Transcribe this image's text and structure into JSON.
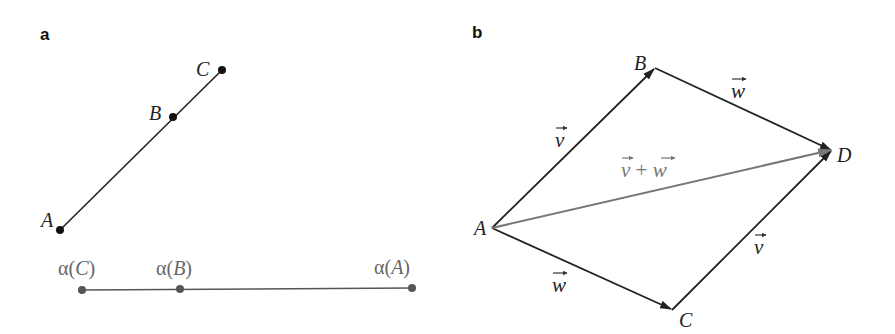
{
  "panels": [
    {
      "label": "a",
      "points": {
        "A": {
          "label": "A",
          "x": 60,
          "y": 230
        },
        "B": {
          "label": "B",
          "x": 173,
          "y": 117
        },
        "C": {
          "label": "C",
          "x": 222,
          "y": 70
        }
      },
      "image_line": {
        "points": [
          {
            "label_fn": "α(",
            "label_var": "C",
            "label_close": ")",
            "x": 82,
            "y": 290
          },
          {
            "label_fn": "α(",
            "label_var": "B",
            "label_close": ")",
            "x": 180,
            "y": 289
          },
          {
            "label_fn": "α(",
            "label_var": "A",
            "label_close": ")",
            "x": 412,
            "y": 288
          }
        ]
      }
    },
    {
      "label": "b",
      "points": {
        "A": {
          "label": "A",
          "x": 492,
          "y": 228
        },
        "B": {
          "label": "B",
          "x": 655,
          "y": 68
        },
        "C": {
          "label": "C",
          "x": 672,
          "y": 310
        },
        "D": {
          "label": "D",
          "x": 832,
          "y": 150
        }
      },
      "vectors": [
        {
          "from": "A",
          "to": "B",
          "label": "v"
        },
        {
          "from": "B",
          "to": "D",
          "label": "w"
        },
        {
          "from": "A",
          "to": "C",
          "label": "w"
        },
        {
          "from": "C",
          "to": "D",
          "label": "v"
        },
        {
          "from": "A",
          "to": "D",
          "label_left": "v",
          "label_op": " + ",
          "label_right": "w",
          "color": "#777777"
        }
      ]
    }
  ],
  "colors": {
    "stroke": "#222222",
    "diagonal": "#777777",
    "image_points": "#555555"
  }
}
